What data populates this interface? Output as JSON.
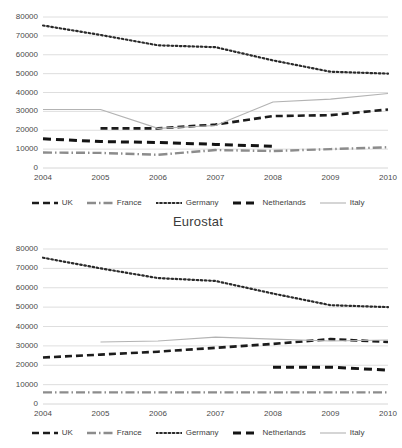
{
  "charts": [
    {
      "id": "chart-top",
      "title": "",
      "legend_items": [
        {
          "name": "UK",
          "style": "dashed",
          "color": "#1c1c1c"
        },
        {
          "name": "France",
          "style": "dashdot",
          "color": "#8c8c8c"
        },
        {
          "name": "Germany",
          "style": "dotted",
          "color": "#2a2a2a"
        },
        {
          "name": "Netherlands",
          "style": "thick-dash",
          "color": "#141414"
        },
        {
          "name": "Italy",
          "style": "solid-light",
          "color": "#b3b3b3"
        }
      ]
    },
    {
      "id": "chart-bottom",
      "title": "Eurostat",
      "legend_items": [
        {
          "name": "UK",
          "style": "dashed",
          "color": "#1c1c1c"
        },
        {
          "name": "France",
          "style": "dashdot",
          "color": "#8c8c8c"
        },
        {
          "name": "Germany",
          "style": "dotted",
          "color": "#2a2a2a"
        },
        {
          "name": "Netherlands",
          "style": "thick-dash",
          "color": "#141414"
        },
        {
          "name": "Italy",
          "style": "solid-light",
          "color": "#b3b3b3"
        }
      ]
    }
  ],
  "chart_data": [
    {
      "type": "line",
      "title": "",
      "xlabel": "",
      "ylabel": "",
      "grid": true,
      "legend_position": "bottom",
      "categories": [
        2004,
        2005,
        2006,
        2007,
        2008,
        2009,
        2010
      ],
      "ylim": [
        0,
        80000
      ],
      "yticks": [
        0,
        10000,
        20000,
        30000,
        40000,
        50000,
        60000,
        70000,
        80000
      ],
      "xticklabels": [
        "2004",
        "2005",
        "2006",
        "2007",
        "2008",
        "2009",
        "2010"
      ],
      "series": [
        {
          "name": "UK",
          "style": "dashed",
          "color": "#1c1c1c",
          "x": [
            2005,
            2006,
            2007,
            2008,
            2009,
            2010
          ],
          "values": [
            21000,
            21000,
            23000,
            27500,
            28000,
            31000
          ]
        },
        {
          "name": "France",
          "style": "dashdot",
          "color": "#8c8c8c",
          "x": [
            2004,
            2005,
            2006,
            2007,
            2008,
            2009,
            2010
          ],
          "values": [
            8200,
            8000,
            7000,
            9500,
            9000,
            10000,
            11000
          ]
        },
        {
          "name": "Germany",
          "style": "dotted",
          "color": "#2a2a2a",
          "x": [
            2004,
            2005,
            2006,
            2007,
            2008,
            2009,
            2010
          ],
          "values": [
            75500,
            70500,
            65000,
            64000,
            57000,
            51000,
            50000
          ]
        },
        {
          "name": "Netherlands",
          "style": "thick-dash",
          "color": "#141414",
          "x": [
            2004,
            2005,
            2006,
            2007,
            2008
          ],
          "values": [
            15500,
            14000,
            13500,
            12500,
            11500
          ]
        },
        {
          "name": "Italy",
          "style": "solid-light",
          "color": "#b3b3b3",
          "x": [
            2004,
            2005,
            2006,
            2007,
            2008,
            2009,
            2010
          ],
          "values": [
            31000,
            31000,
            21000,
            22500,
            35000,
            36500,
            39500
          ]
        }
      ]
    },
    {
      "type": "line",
      "title": "Eurostat",
      "xlabel": "",
      "ylabel": "",
      "grid": true,
      "legend_position": "bottom",
      "categories": [
        2004,
        2005,
        2006,
        2007,
        2008,
        2009,
        2010
      ],
      "ylim": [
        0,
        80000
      ],
      "yticks": [
        0,
        10000,
        20000,
        30000,
        40000,
        50000,
        60000,
        70000,
        80000
      ],
      "xticklabels": [
        "2004",
        "2005",
        "2006",
        "2007",
        "2008",
        "2009",
        "2010"
      ],
      "series": [
        {
          "name": "UK",
          "style": "dashed",
          "color": "#1c1c1c",
          "x": [
            2004,
            2005,
            2006,
            2007,
            2008,
            2009,
            2010
          ],
          "values": [
            24000,
            25500,
            27000,
            29000,
            31000,
            33500,
            32000
          ]
        },
        {
          "name": "France",
          "style": "dashdot",
          "color": "#8c8c8c",
          "x": [
            2004,
            2005,
            2006,
            2007,
            2008,
            2009,
            2010
          ],
          "values": [
            6000,
            6000,
            6000,
            6000,
            6000,
            6000,
            6000
          ]
        },
        {
          "name": "Germany",
          "style": "dotted",
          "color": "#2a2a2a",
          "x": [
            2004,
            2005,
            2006,
            2007,
            2008,
            2009,
            2010
          ],
          "values": [
            75500,
            70000,
            65000,
            63500,
            57000,
            51000,
            50000
          ]
        },
        {
          "name": "Netherlands",
          "style": "thick-dash",
          "color": "#141414",
          "x": [
            2008,
            2009,
            2010
          ],
          "values": [
            19000,
            19000,
            17500
          ]
        },
        {
          "name": "Italy",
          "style": "solid-light",
          "color": "#b3b3b3",
          "x": [
            2005,
            2006,
            2007,
            2008,
            2009,
            2010
          ],
          "values": [
            32000,
            32500,
            34500,
            33500,
            32500,
            33000
          ]
        }
      ]
    }
  ]
}
